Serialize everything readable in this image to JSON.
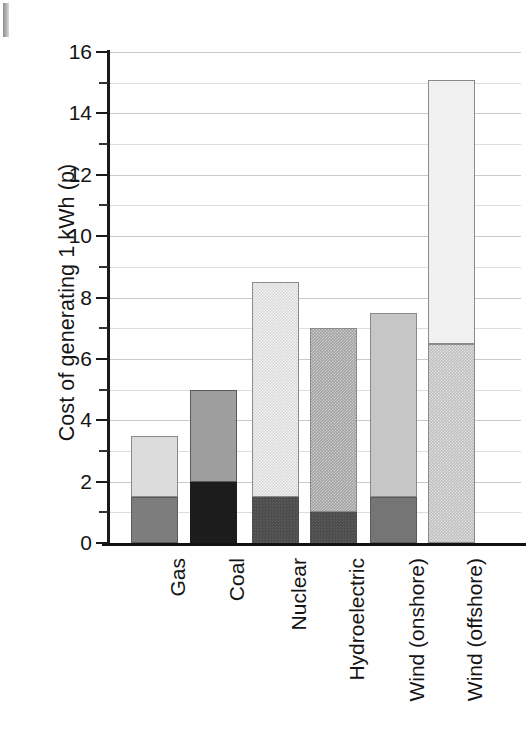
{
  "chart_data": {
    "type": "bar",
    "stacked": true,
    "title": "",
    "subtitle": "",
    "xlabel": "",
    "ylabel": "Cost of generating 1 kWh (p)",
    "ylim": [
      0,
      16
    ],
    "ytick_step": 2,
    "ytick_labels": [
      "0",
      "2",
      "4",
      "6",
      "8",
      "10",
      "12",
      "14",
      "16"
    ],
    "minor_ticks": [
      1,
      3,
      5,
      7,
      9,
      11,
      13,
      15
    ],
    "grid": "horizontal",
    "legend": "none",
    "categories": [
      "Gas",
      "Coal",
      "Nuclear",
      "Hydroelectric",
      "Wind (onshore)",
      "Wind (offshore)"
    ],
    "series": [
      {
        "name": "lower segment",
        "values": [
          1.5,
          2.0,
          1.5,
          1.0,
          1.5,
          6.5
        ]
      },
      {
        "name": "upper segment",
        "values": [
          2.0,
          3.0,
          7.0,
          6.0,
          6.0,
          8.6
        ]
      }
    ],
    "totals": [
      3.5,
      5.0,
      8.5,
      7.0,
      7.5,
      15.1
    ],
    "bars": [
      {
        "category": "Gas",
        "total": 3.5,
        "segments": [
          {
            "from": 0,
            "to": 1.5,
            "fill": "#7d7d7d",
            "texture": "solid"
          },
          {
            "from": 1.5,
            "to": 3.5,
            "fill": "#dcdcdc",
            "texture": "solid"
          }
        ]
      },
      {
        "category": "Coal",
        "total": 5.0,
        "segments": [
          {
            "from": 0,
            "to": 2.0,
            "fill": "#1c1c1c",
            "texture": "solid"
          },
          {
            "from": 2.0,
            "to": 5.0,
            "fill": "#9e9e9e",
            "texture": "solid"
          }
        ]
      },
      {
        "category": "Nuclear",
        "total": 8.5,
        "segments": [
          {
            "from": 0,
            "to": 1.5,
            "fill": "#4d4d4d",
            "texture": "dotted"
          },
          {
            "from": 1.5,
            "to": 8.5,
            "fill": "#dadada",
            "texture": "dotted"
          }
        ]
      },
      {
        "category": "Hydroelectric",
        "total": 7.0,
        "segments": [
          {
            "from": 0,
            "to": 1.0,
            "fill": "#4d4d4d",
            "texture": "dotted"
          },
          {
            "from": 1.0,
            "to": 7.0,
            "fill": "#a2a2a2",
            "texture": "dotted"
          }
        ]
      },
      {
        "category": "Wind (onshore)",
        "total": 7.5,
        "segments": [
          {
            "from": 0,
            "to": 1.5,
            "fill": "#757575",
            "texture": "solid"
          },
          {
            "from": 1.5,
            "to": 7.5,
            "fill": "#c6c6c6",
            "texture": "solid"
          }
        ]
      },
      {
        "category": "Wind (offshore)",
        "total": 15.1,
        "segments": [
          {
            "from": 0,
            "to": 6.5,
            "fill": "#bfbfbf",
            "texture": "dotted"
          },
          {
            "from": 6.5,
            "to": 15.1,
            "fill": "#f0f0f0",
            "texture": "solid"
          }
        ]
      }
    ],
    "colors": {
      "axis": "#1a1a1a",
      "gridline": "#c9c9c9",
      "gridline_minor": "#dddddd",
      "text": "#141414",
      "background": "#ffffff"
    }
  }
}
